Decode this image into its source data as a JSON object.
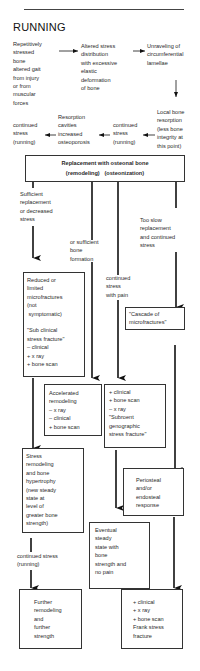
{
  "title": "RUNNING",
  "nodes": {
    "repetitive": "Repetitively\nstressed\nbone\naltered gait\nfrom injury\nor from\nmuscular\nforces",
    "altered": "Altered stress\ndistribution\nwith excessive\nelastic\ndeformation\nof bone",
    "unraveling": "Unraveling of\ncircumferential\nlamellae",
    "local": "Local bone\nresorption\n(less bone\nintegrity at\nthis point)",
    "cont1": "continued\nstress\n(running)",
    "resorption": "Resorption\ncavities\nincreased\nosteoporosis",
    "cont2": "continued\nstress\n(running)",
    "replacement_line1": "Replacement with osteonal bone",
    "replacement_line2": "(remodeling)   (osteonization)",
    "sufficient": "Sufficient\nreplacement\nor decreased\nstress",
    "orsufficient": "or sufficient\nbone\nformation",
    "tooslow": "Too slow\nreplacement\nand continued\nstress",
    "contpain": "continued\nstress\nwith pain",
    "reduced": "Reduced or\nlimited\nmicrofractures\n(not\n symptomatic)\n\n\"Sub clinical\nstress fracture\"\n– clinical\n+ x ray\n+ bone scan",
    "cascade": "\"Cascade of\nmicrofractures\"",
    "accelerated": "Accelerated\nremodeling\n– x ray\n– clinical\n+ bone scan",
    "subroent": "+ clinical\n+ bone scan\n– x ray\n\"Subroent\ngenographic\nstress fracture\"",
    "stressremod": "Stress\nremodeling\nand bone\nhypertrophy\n(new steady\nstate at\nlevel of\ngreater bone\nstrength)",
    "periosteal": "Periosteal\nand/or\nendosteal\nresponse",
    "eventual": "Eventual\nsteady\nstate with\nbone\nstrength and\nno pain",
    "cont3": "continued stress\n(running)",
    "further": "Further\nremodeling\nand\nfurther\nstrength",
    "frank": "+ clinical\n+ x ray\n+ bone scan\nFrank stress\nfracture"
  }
}
